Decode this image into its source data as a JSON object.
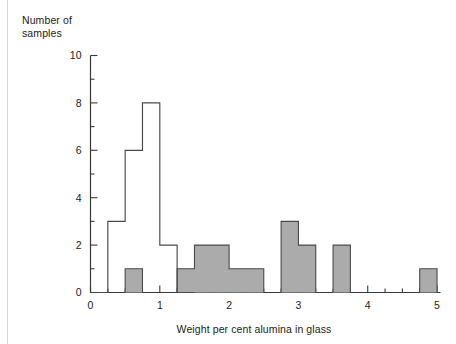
{
  "figure": {
    "ylabel": "Number of\nsamples",
    "xlabel": "Weight per cent alumina in glass",
    "y_ticks": [
      "0",
      "2",
      "4",
      "6",
      "8",
      "10"
    ],
    "x_ticks": [
      "0",
      "1",
      "2",
      "3",
      "4",
      "5"
    ]
  },
  "colors": {
    "bar_fill": "#ababab",
    "bar_stroke": "#4a4a4a",
    "axis": "#3a3a3a",
    "outline_stroke": "#4a4a4a",
    "background": "#ffffff",
    "text": "#1c1c1c"
  },
  "chart_data": {
    "type": "bar",
    "title": "",
    "xlabel": "Weight per cent alumina in glass",
    "ylabel": "Number of samples",
    "xlim": [
      0,
      5.05
    ],
    "ylim": [
      0,
      10
    ],
    "bin_width": 0.25,
    "x_ticks": [
      0,
      1,
      2,
      3,
      4,
      5
    ],
    "y_ticks": [
      0,
      2,
      4,
      6,
      8,
      10
    ],
    "x_minor_tick_step": 0.25,
    "y_minor_tick_step": 1,
    "grid": false,
    "legend": null,
    "series": [
      {
        "name": "filled-grey-histogram",
        "style": "filled",
        "fill": "#ababab",
        "bins": [
          {
            "x0": 0.0,
            "x1": 0.25,
            "count": 0
          },
          {
            "x0": 0.25,
            "x1": 0.5,
            "count": 0
          },
          {
            "x0": 0.5,
            "x1": 0.75,
            "count": 1
          },
          {
            "x0": 0.75,
            "x1": 1.0,
            "count": 0
          },
          {
            "x0": 1.0,
            "x1": 1.25,
            "count": 0
          },
          {
            "x0": 1.25,
            "x1": 1.5,
            "count": 1
          },
          {
            "x0": 1.5,
            "x1": 1.75,
            "count": 2
          },
          {
            "x0": 1.75,
            "x1": 2.0,
            "count": 2
          },
          {
            "x0": 2.0,
            "x1": 2.25,
            "count": 1
          },
          {
            "x0": 2.25,
            "x1": 2.5,
            "count": 1
          },
          {
            "x0": 2.5,
            "x1": 2.75,
            "count": 0
          },
          {
            "x0": 2.75,
            "x1": 3.0,
            "count": 3
          },
          {
            "x0": 3.0,
            "x1": 3.25,
            "count": 2
          },
          {
            "x0": 3.25,
            "x1": 3.5,
            "count": 0
          },
          {
            "x0": 3.5,
            "x1": 3.75,
            "count": 2
          },
          {
            "x0": 3.75,
            "x1": 4.0,
            "count": 0
          },
          {
            "x0": 4.0,
            "x1": 4.25,
            "count": 0
          },
          {
            "x0": 4.25,
            "x1": 4.5,
            "count": 0
          },
          {
            "x0": 4.5,
            "x1": 4.75,
            "count": 0
          },
          {
            "x0": 4.75,
            "x1": 5.0,
            "count": 1
          }
        ]
      },
      {
        "name": "outline-white-histogram",
        "style": "outline",
        "fill": "none",
        "bins": [
          {
            "x0": 0.0,
            "x1": 0.25,
            "count": 0
          },
          {
            "x0": 0.25,
            "x1": 0.5,
            "count": 3
          },
          {
            "x0": 0.5,
            "x1": 0.75,
            "count": 6
          },
          {
            "x0": 0.75,
            "x1": 1.0,
            "count": 8
          },
          {
            "x0": 1.0,
            "x1": 1.25,
            "count": 2
          },
          {
            "x0": 1.25,
            "x1": 1.5,
            "count": 0
          }
        ]
      }
    ]
  }
}
